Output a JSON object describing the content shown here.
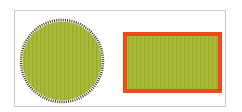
{
  "figure": {
    "background": "#ffffff",
    "frame_border": "#c8c8c8",
    "shapes": [
      {
        "kind": "circle",
        "name": "serrated-circle",
        "cx": 62,
        "cy": 61,
        "r": 40,
        "fill": "#aabb3a",
        "stripe": "#9aab30",
        "edge": "#4a4a2a",
        "edge_style": "serrated"
      },
      {
        "kind": "rectangle",
        "name": "bordered-rectangle",
        "x": 123,
        "y": 32,
        "width": 99,
        "height": 61,
        "fill": "#aabb3a",
        "stripe": "#9aab30",
        "stroke": "#f04a18",
        "stroke_width": 4
      }
    ]
  }
}
